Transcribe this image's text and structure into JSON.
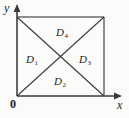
{
  "figure": {
    "type": "geometry-diagram",
    "background_color": "#fbfbfa",
    "stroke_color": "#3a3a3a",
    "text_color": "#1c1c1c",
    "axes": {
      "x_label": "x",
      "y_label": "y",
      "origin_label": "0",
      "x_arrow": "arrow-right",
      "y_arrow": "arrow-up"
    },
    "square": {
      "left": 17,
      "top": 17,
      "right": 104,
      "bottom": 96
    },
    "regions": [
      {
        "id": "D1",
        "base": "D",
        "subscript": "1",
        "position": "left"
      },
      {
        "id": "D2",
        "base": "D",
        "subscript": "2",
        "position": "bottom"
      },
      {
        "id": "D3",
        "base": "D",
        "subscript": "3",
        "position": "right"
      },
      {
        "id": "D4",
        "base": "D",
        "subscript": "4",
        "position": "top"
      }
    ]
  }
}
